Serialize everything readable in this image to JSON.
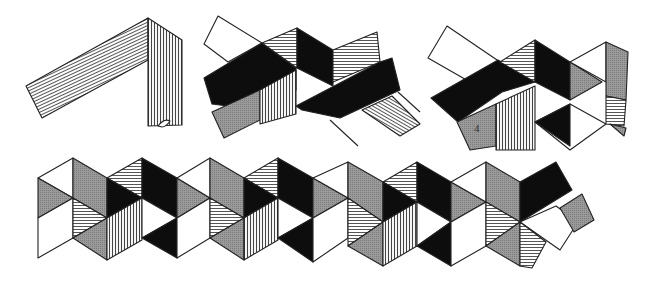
{
  "figure": {
    "colors": {
      "background": "#ffffff",
      "line": "#222222",
      "black_face": "#0d0d0d",
      "white_face": "#ffffff",
      "horizontal_hatch": "#8a8a8a",
      "vertical_hatch": "#7a7a7a",
      "diagonal_hatch": "#909090"
    },
    "stages": [
      {
        "id": "stage-1",
        "description": "Strip folded once at a corner (L-shaped fold)"
      },
      {
        "id": "stage-2",
        "description": "Strip woven into a cross with black and hatched faces"
      },
      {
        "id": "stage-3",
        "description": "Strip folded into partial hexagon with numbered face",
        "face_label": "4"
      },
      {
        "id": "stage-4",
        "description": "Long strip of triangular/rhombic faces folded into a row of cubes"
      }
    ]
  }
}
